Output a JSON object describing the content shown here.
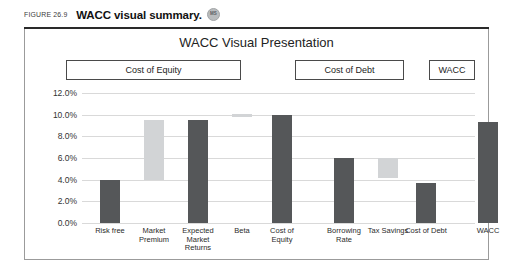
{
  "figure": {
    "number": "FIGURE 26.9",
    "title": "WACC visual summary.",
    "badge_label": "MS",
    "badge_icon": "circle-badge-icon"
  },
  "colors": {
    "bar_dark": "#555759",
    "bar_light": "#d2d4d6",
    "gridline": "#d9d9d9",
    "panel_border": "#9b9b9b",
    "rule": "#2a2a2a"
  },
  "groups": [
    {
      "label": "Cost of Equity",
      "name": "group-box-cost-of-equity"
    },
    {
      "label": "Cost of Debt",
      "name": "group-box-cost-of-debt"
    },
    {
      "label": "WACC",
      "name": "group-box-wacc"
    }
  ],
  "chart_data": {
    "type": "bar",
    "title": "WACC Visual Presentation",
    "xlabel": "",
    "ylabel": "",
    "ylim": [
      0,
      12
    ],
    "yticks": [
      "0.0%",
      "2.0%",
      "4.0%",
      "6.0%",
      "8.0%",
      "10.0%",
      "12.0%"
    ],
    "ytick_values": [
      0,
      2,
      4,
      6,
      8,
      10,
      12
    ],
    "grid": true,
    "legend": "none",
    "categories": [
      "Risk free",
      "Market Premium",
      "Expected Market Returns",
      "Beta",
      "Cost of Equity",
      "Borrowing Rate",
      "Tax Savings",
      "Cost of Debt",
      "WACC"
    ],
    "bars": [
      {
        "category": "Risk free",
        "base": 0.0,
        "top": 4.0,
        "value": 4.0,
        "shade": "dark"
      },
      {
        "category": "Market Premium",
        "base": 4.0,
        "top": 9.5,
        "value": 5.5,
        "shade": "light"
      },
      {
        "category": "Expected Market Returns",
        "base": 0.0,
        "top": 9.5,
        "value": 9.5,
        "shade": "dark"
      },
      {
        "category": "Beta",
        "base": 9.8,
        "top": 10.1,
        "value": 10.0,
        "shade": "light"
      },
      {
        "category": "Cost of Equity",
        "base": 0.0,
        "top": 10.0,
        "value": 10.0,
        "shade": "dark"
      },
      {
        "category": "Borrowing Rate",
        "base": 0.0,
        "top": 6.0,
        "value": 6.0,
        "shade": "dark"
      },
      {
        "category": "Tax Savings",
        "base": 4.2,
        "top": 6.0,
        "value": 1.8,
        "shade": "light"
      },
      {
        "category": "Cost of Debt",
        "base": 0.0,
        "top": 3.7,
        "value": 3.7,
        "shade": "dark"
      },
      {
        "category": "WACC",
        "base": 0.0,
        "top": 9.3,
        "value": 9.3,
        "shade": "dark"
      }
    ],
    "bar_centers_pct": [
      9.0,
      22.5,
      36.0,
      49.5,
      62.0,
      80.0,
      90.5,
      101.5,
      120.0
    ]
  },
  "layout": {
    "bar_width_px": 20,
    "bar_slots_px": [
      18,
      62,
      106,
      150,
      190,
      252,
      296,
      334,
      396
    ]
  }
}
